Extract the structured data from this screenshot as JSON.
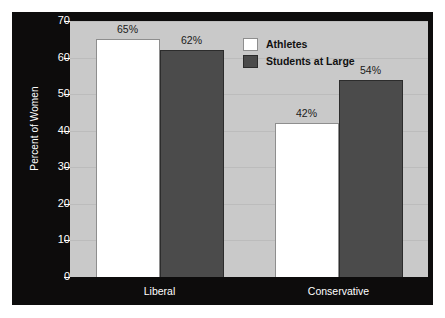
{
  "chart_data": {
    "type": "bar",
    "title": "",
    "xlabel": "",
    "ylabel": "Percent of Women",
    "ylim": [
      0,
      70
    ],
    "yticks": [
      0,
      10,
      20,
      30,
      40,
      50,
      60,
      70
    ],
    "ytick_labels": [
      "0",
      "10",
      "20",
      "30",
      "40",
      "50",
      "60",
      "70"
    ],
    "grid": true,
    "legend_position": "top-right inside plot",
    "categories": [
      "Liberal",
      "Conservative"
    ],
    "series": [
      {
        "name": "Athletes",
        "color": "#ffffff",
        "values": [
          65,
          42
        ],
        "data_labels": [
          "65%",
          "42%"
        ]
      },
      {
        "name": "Students at Large",
        "color": "#4b4b4b",
        "values": [
          62,
          54
        ],
        "data_labels": [
          "62%",
          "54%"
        ]
      }
    ]
  },
  "colors": {
    "frame": "#0d0c0c",
    "plot_background": "#c9c9c9",
    "gridline": "#bcbcbc",
    "athletes_bar": "#ffffff",
    "students_bar": "#4b4b4b",
    "axis_text": "#ffffff",
    "label_text": "#1a1a1a"
  }
}
